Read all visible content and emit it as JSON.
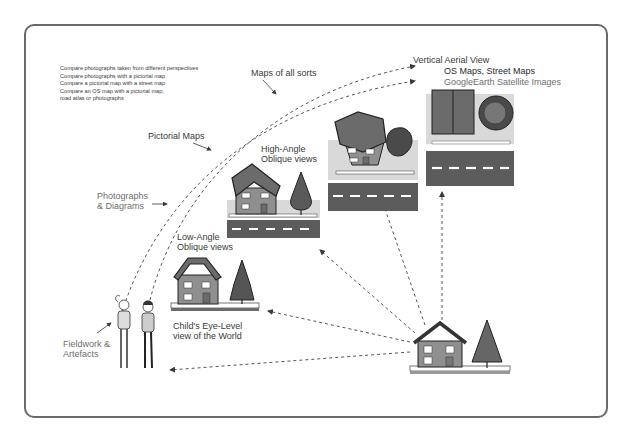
{
  "diagram": {
    "activities": [
      "Compare photographs taken from different perspectives",
      "Compare photographs with a pictorial map",
      "Compare a pictorial map with a street map",
      "Compare an OS map with  a pictorial map,",
      "road atlas or photographs"
    ],
    "resource_labels": {
      "maps_all_sorts": "Maps of all sorts",
      "pictorial_maps": "Pictorial Maps",
      "photographs_line1": "Photographs",
      "photographs_line2": "& Diagrams",
      "fieldwork_line1": "Fieldwork &",
      "fieldwork_line2": "Artefacts"
    },
    "views": {
      "vertical_title": "Vertical Aerial View",
      "vertical_os": "OS Maps, Street Maps",
      "vertical_google": "GoogleEarth Satellite Images",
      "high_line1": "High-Angle",
      "high_line2": "Oblique views",
      "low_line1": "Low-Angle",
      "low_line2": "Oblique views",
      "child_line1": "Child's Eye-Level",
      "child_line2": "view of the World"
    },
    "colors": {
      "roof": "#6b6b6b",
      "wall": "#8f8f8f",
      "tree": "#6a6a6a",
      "road": "#5c5c5c",
      "ground": "#d9d9d9",
      "frame": "#6a6a6a"
    }
  }
}
